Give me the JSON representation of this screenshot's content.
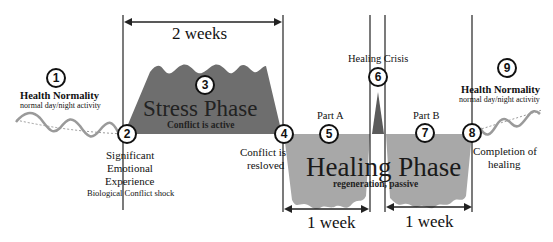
{
  "diagram": {
    "durations": {
      "stress": "2 weeks",
      "healing_part_a": "1 week",
      "healing_part_b": "1 week"
    },
    "stages": [
      {
        "number": "1",
        "title": "Health Normality",
        "subtitle": "normal day/night activity"
      },
      {
        "number": "2",
        "title_lines": [
          "Significant",
          "Emotional",
          "Experience"
        ],
        "subtitle": "Biological Conflict shock"
      },
      {
        "number": "3",
        "title": "Stress Phase",
        "subtitle": "Conflict is active"
      },
      {
        "number": "4",
        "title_lines": [
          "Conflict is",
          "resloved"
        ]
      },
      {
        "number": "5",
        "title": "Part A"
      },
      {
        "number": "6",
        "title": "Healing Crisis"
      },
      {
        "number": "7",
        "title": "Part B"
      },
      {
        "number": "8",
        "title_lines": [
          "Completion of",
          "healing"
        ]
      },
      {
        "number": "9",
        "title": "Health Normality",
        "subtitle": "normal day/night activity"
      }
    ],
    "healing_phase": {
      "title": "Healing Phase",
      "subtitle": "regeneration, passive"
    },
    "colors": {
      "stress_fill": "#6e6e6e",
      "healing_fill": "#a8a8a8",
      "wave": "#9a9a9a",
      "lines": "#222222"
    }
  }
}
